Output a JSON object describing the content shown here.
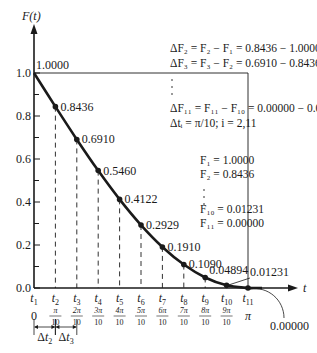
{
  "chart_data": {
    "type": "line",
    "title": "",
    "xlabel": "t",
    "ylabel": "F(t)",
    "ylim": [
      0.0,
      1.0
    ],
    "xlim": [
      0,
      3.14159
    ],
    "grid": false,
    "legend": null,
    "y_ticks": [
      "0.0",
      "0.2",
      "0.4",
      "0.6",
      "0.8",
      "1.0"
    ],
    "x_ticks": [
      "t1",
      "t2",
      "t3",
      "t4",
      "t5",
      "t6",
      "t7",
      "t8",
      "t9",
      "t10",
      "t11"
    ],
    "x_tick_values": [
      "0",
      "π/10",
      "2π/10",
      "3π/10",
      "4π/10",
      "5π/10",
      "6π/10",
      "7π/10",
      "8π/10",
      "9π/10",
      "π"
    ],
    "points": [
      {
        "t": "t1",
        "x": 0.0,
        "value": 1.0,
        "label": "1.0000"
      },
      {
        "t": "t2",
        "x": 0.31416,
        "value": 0.8436,
        "label": "0.8436"
      },
      {
        "t": "t3",
        "x": 0.62832,
        "value": 0.691,
        "label": "0.6910"
      },
      {
        "t": "t4",
        "x": 0.94248,
        "value": 0.546,
        "label": "0.5460"
      },
      {
        "t": "t5",
        "x": 1.25664,
        "value": 0.4122,
        "label": "0.4122"
      },
      {
        "t": "t6",
        "x": 1.5708,
        "value": 0.2929,
        "label": "0.2929"
      },
      {
        "t": "t7",
        "x": 1.88496,
        "value": 0.191,
        "label": "0.1910"
      },
      {
        "t": "t8",
        "x": 2.19911,
        "value": 0.109,
        "label": "0.1090"
      },
      {
        "t": "t9",
        "x": 2.51327,
        "value": 0.04894,
        "label": "0.04894"
      },
      {
        "t": "t10",
        "x": 2.82743,
        "value": 0.01231,
        "label": "0.01231"
      },
      {
        "t": "t11",
        "x": 3.14159,
        "value": 0.0,
        "label": "0.00000"
      }
    ],
    "annotations": {
      "delta_F2": "ΔF₂ = F₂ − F₁ = 0.8436 − 1.0000",
      "delta_F3": "ΔF₃ = F₃ − F₂ = 0.6910 − 0.8436",
      "delta_F11": "ΔF₁₁ = F₁₁ − F₁₀ = 0.00000 − 0.01231",
      "delta_t": "Δtᵢ = π/10; i = 2,11",
      "F1": "F₁ = 1.0000",
      "F2": "F₂ = 0.8436",
      "F10": "F₁₀ = 0.01231",
      "F11": "F₁₁ = 0.00000",
      "delta_t2": "Δt₂",
      "delta_t3": "Δt₃"
    }
  },
  "axis": {
    "y_title": "F(t)",
    "x_title": "t"
  },
  "colors": {
    "ink": "#1a1a1a",
    "background": "#ffffff"
  }
}
